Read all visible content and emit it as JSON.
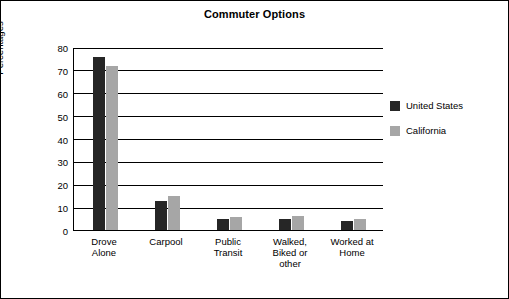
{
  "chart_data": {
    "type": "bar",
    "title": "Commuter Options",
    "xlabel": "",
    "ylabel": "Percentages",
    "ylim": [
      0,
      80
    ],
    "yticks": [
      0,
      10,
      20,
      30,
      40,
      50,
      60,
      70,
      80
    ],
    "grid": true,
    "legend_position": "right",
    "categories": [
      "Drove\nAlone",
      "Carpool",
      "Public\nTransit",
      "Walked,\nBiked or\nother",
      "Worked at\nHome"
    ],
    "category_lines": [
      [
        "Drove",
        "Alone"
      ],
      [
        "Carpool"
      ],
      [
        "Public",
        "Transit"
      ],
      [
        "Walked,",
        "Biked or",
        "other"
      ],
      [
        "Worked at",
        "Home"
      ]
    ],
    "series": [
      {
        "name": "United States",
        "color": "#262626",
        "values": [
          75.5,
          12.5,
          5,
          5,
          4
        ]
      },
      {
        "name": "California",
        "color": "#a6a6a6",
        "values": [
          71.5,
          15,
          5.5,
          6,
          5
        ]
      }
    ]
  }
}
